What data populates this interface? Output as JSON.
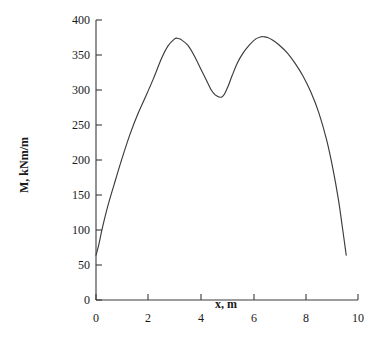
{
  "chart_data": {
    "type": "line",
    "title": "",
    "xlabel": "x, m",
    "ylabel": "M, kNm/m",
    "xlim": [
      0,
      10
    ],
    "ylim": [
      0,
      400
    ],
    "grid": false,
    "legend": null,
    "x_ticks": [
      "0",
      "2",
      "4",
      "6",
      "8",
      "10"
    ],
    "x_tick_values": [
      0,
      2,
      4,
      6,
      8,
      10
    ],
    "y_ticks": [
      "0",
      "50",
      "100",
      "150",
      "200",
      "250",
      "300",
      "350",
      "400"
    ],
    "y_tick_values": [
      0,
      50,
      100,
      150,
      200,
      250,
      300,
      350,
      400
    ],
    "series": [
      {
        "name": "bending moment",
        "color": "#3b3b3b",
        "x": [
          0.0,
          0.1,
          0.25,
          0.45,
          0.7,
          1.0,
          1.3,
          1.6,
          1.9,
          2.2,
          2.5,
          2.75,
          3.0,
          3.1,
          3.25,
          3.5,
          3.75,
          4.0,
          4.2,
          4.4,
          4.55,
          4.7,
          4.8,
          4.9,
          5.05,
          5.2,
          5.4,
          5.6,
          5.85,
          6.1,
          6.3,
          6.4,
          6.55,
          6.75,
          7.0,
          7.3,
          7.6,
          7.9,
          8.2,
          8.5,
          8.8,
          9.05,
          9.25,
          9.4,
          9.55
        ],
        "y": [
          64,
          78,
          104,
          134,
          166,
          203,
          237,
          266,
          291,
          317,
          345,
          363,
          373,
          374,
          372,
          364,
          349,
          330,
          315,
          300,
          293,
          290,
          290,
          294,
          306,
          321,
          339,
          352,
          364,
          373,
          376,
          376,
          375,
          371,
          364,
          353,
          338,
          320,
          297,
          268,
          229,
          186,
          144,
          105,
          64
        ],
        "annotations": [
          {
            "label": "left end",
            "x": 0.0,
            "y": 64
          },
          {
            "label": "first peak",
            "x": 3.1,
            "y": 374
          },
          {
            "label": "local minimum",
            "x": 4.8,
            "y": 290
          },
          {
            "label": "second peak",
            "x": 6.4,
            "y": 376
          },
          {
            "label": "right end",
            "x": 9.55,
            "y": 64
          }
        ]
      }
    ]
  }
}
